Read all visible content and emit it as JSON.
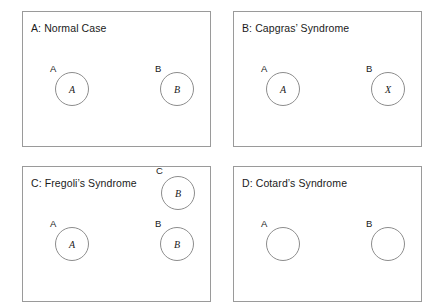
{
  "figure": {
    "name": "delusional-misidentification-diagram",
    "background_color": "#ffffff",
    "border_color": "#9a9a9a",
    "circle_stroke_color": "#8d8d8d",
    "text_color": "#1a1a1a"
  },
  "panels": [
    {
      "id": "panel-a",
      "title": "A: Normal Case",
      "box": {
        "x": 22,
        "y": 11,
        "w": 189,
        "h": 136
      },
      "title_pos": {
        "x": 31,
        "y": 22
      },
      "nodes": [
        {
          "name": "node-a",
          "label": "A",
          "inner": "A",
          "label_pos": {
            "x": 50,
            "y": 64
          },
          "circle": {
            "cx": 72,
            "cy": 89,
            "r": 17
          }
        },
        {
          "name": "node-b",
          "label": "B",
          "inner": "B",
          "label_pos": {
            "x": 155,
            "y": 64
          },
          "circle": {
            "cx": 177,
            "cy": 89,
            "r": 17
          }
        }
      ]
    },
    {
      "id": "panel-b",
      "title": "B: Capgras’ Syndrome",
      "box": {
        "x": 233,
        "y": 11,
        "w": 189,
        "h": 136
      },
      "title_pos": {
        "x": 242,
        "y": 22
      },
      "nodes": [
        {
          "name": "node-a",
          "label": "A",
          "inner": "A",
          "label_pos": {
            "x": 261,
            "y": 64
          },
          "circle": {
            "cx": 283,
            "cy": 89,
            "r": 17
          }
        },
        {
          "name": "node-b",
          "label": "B",
          "inner": "X",
          "label_pos": {
            "x": 366,
            "y": 64
          },
          "circle": {
            "cx": 388,
            "cy": 89,
            "r": 17
          }
        }
      ]
    },
    {
      "id": "panel-c",
      "title": "C: Fregoli’s Syndrome",
      "box": {
        "x": 22,
        "y": 166,
        "w": 189,
        "h": 136
      },
      "title_pos": {
        "x": 31,
        "y": 177
      },
      "nodes": [
        {
          "name": "node-c",
          "label": "C",
          "inner": "B",
          "label_pos": {
            "x": 156,
            "y": 166
          },
          "circle": {
            "cx": 178,
            "cy": 193,
            "r": 17
          }
        },
        {
          "name": "node-a",
          "label": "A",
          "inner": "A",
          "label_pos": {
            "x": 50,
            "y": 219
          },
          "circle": {
            "cx": 72,
            "cy": 244,
            "r": 17
          }
        },
        {
          "name": "node-b",
          "label": "B",
          "inner": "B",
          "label_pos": {
            "x": 155,
            "y": 219
          },
          "circle": {
            "cx": 177,
            "cy": 244,
            "r": 17
          }
        }
      ]
    },
    {
      "id": "panel-d",
      "title": "D: Cotard’s Syndrome",
      "box": {
        "x": 233,
        "y": 166,
        "w": 189,
        "h": 136
      },
      "title_pos": {
        "x": 242,
        "y": 177
      },
      "nodes": [
        {
          "name": "node-a",
          "label": "A",
          "inner": "",
          "label_pos": {
            "x": 261,
            "y": 219
          },
          "circle": {
            "cx": 283,
            "cy": 244,
            "r": 17
          }
        },
        {
          "name": "node-b",
          "label": "B",
          "inner": "",
          "label_pos": {
            "x": 366,
            "y": 219
          },
          "circle": {
            "cx": 388,
            "cy": 244,
            "r": 17
          }
        }
      ]
    }
  ]
}
